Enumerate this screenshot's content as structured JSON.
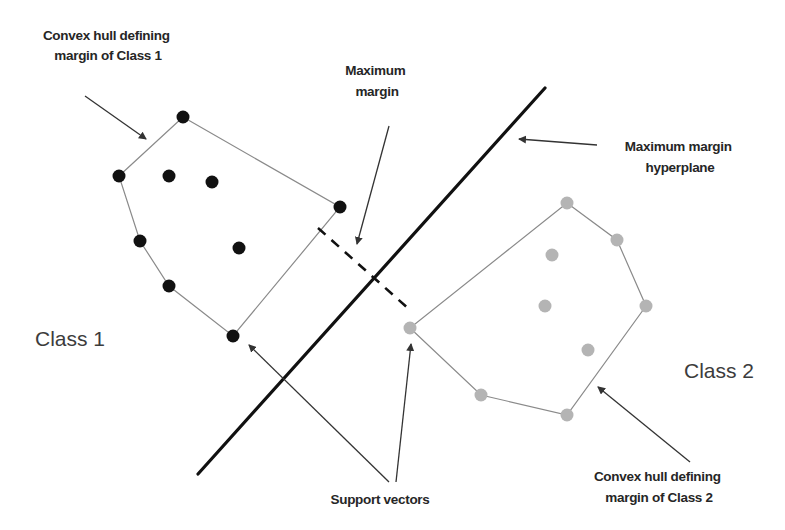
{
  "diagram": {
    "colors": {
      "class1_point": "#111111",
      "class2_point": "#b4b4b4",
      "hull_line": "#8a8a8a",
      "hyperplane": "#111111",
      "arrow": "#333333",
      "text": "#262626"
    },
    "labels": {
      "hull_class1": [
        "Convex hull defining",
        "margin of Class 1"
      ],
      "max_margin": [
        "Maximum",
        "margin"
      ],
      "hyperplane": [
        "Maximum margin",
        "hyperplane"
      ],
      "class1": "Class 1",
      "class2": "Class 2",
      "support_vectors": "Support vectors",
      "hull_class2": [
        "Convex hull defining",
        "margin of Class 2"
      ]
    },
    "class1": {
      "hull": [
        [
          183,
          117
        ],
        [
          340,
          207
        ],
        [
          233,
          336
        ],
        [
          169,
          286
        ],
        [
          140,
          241
        ],
        [
          119,
          176
        ]
      ],
      "points": [
        [
          183,
          117
        ],
        [
          119,
          176
        ],
        [
          169,
          176
        ],
        [
          212,
          182
        ],
        [
          340,
          207
        ],
        [
          140,
          241
        ],
        [
          239,
          248
        ],
        [
          169,
          286
        ],
        [
          233,
          336
        ]
      ]
    },
    "class2": {
      "hull": [
        [
          567,
          203
        ],
        [
          617,
          240
        ],
        [
          646,
          306
        ],
        [
          567,
          415
        ],
        [
          481,
          395
        ],
        [
          410,
          328
        ]
      ],
      "points": [
        [
          567,
          203
        ],
        [
          617,
          240
        ],
        [
          552,
          255
        ],
        [
          545,
          306
        ],
        [
          646,
          306
        ],
        [
          588,
          350
        ],
        [
          410,
          328
        ],
        [
          481,
          395
        ],
        [
          567,
          415
        ]
      ]
    },
    "hyperplane": {
      "x1": 545,
      "y1": 88,
      "x2": 198,
      "y2": 474
    },
    "margin_segment": {
      "x1": 318,
      "y1": 228,
      "x2": 410,
      "y2": 310
    }
  }
}
